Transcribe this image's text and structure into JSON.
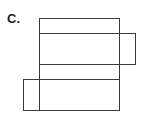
{
  "figure": {
    "label": "C.",
    "stroke_color": "#3a3a3a",
    "faces": [
      {
        "name": "top-face",
        "x": 39.5,
        "y": 18.5,
        "w": 80,
        "h": 15
      },
      {
        "name": "front-face",
        "x": 39.5,
        "y": 33.5,
        "w": 80,
        "h": 31
      },
      {
        "name": "right-side-flap",
        "x": 119.5,
        "y": 33.5,
        "w": 16,
        "h": 31
      },
      {
        "name": "bottom-face",
        "x": 39.5,
        "y": 64.5,
        "w": 80,
        "h": 15
      },
      {
        "name": "back-face",
        "x": 39.5,
        "y": 79.5,
        "w": 80,
        "h": 31
      },
      {
        "name": "left-side-flap",
        "x": 23.5,
        "y": 79.5,
        "w": 16,
        "h": 31
      }
    ]
  }
}
